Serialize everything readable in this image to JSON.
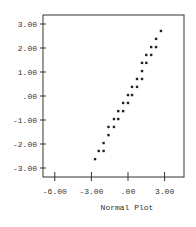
{
  "chart_data": {
    "type": "scatter",
    "title": "",
    "xlabel": "Normal Plot",
    "ylabel": "",
    "xlim": [
      -6.6,
      4.6
    ],
    "ylim": [
      -3.4,
      3.4
    ],
    "x_ticks": [
      -6.0,
      -3.0,
      0.0,
      3.0
    ],
    "x_tick_labels": [
      "-6.00",
      "-3.00",
      ".00",
      "3.00"
    ],
    "y_ticks": [
      3.0,
      2.0,
      1.0,
      0.0,
      -1.0,
      -2.0,
      -3.0
    ],
    "y_tick_labels": [
      "3.00",
      "2.00",
      "1.00",
      ".00",
      "-1.00",
      "-2.00",
      "-3.00"
    ],
    "grid": false,
    "legend": null,
    "marker": "star",
    "color": "#222222",
    "points": [
      {
        "x": -2.7,
        "y": -2.63
      },
      {
        "x": -2.4,
        "y": -2.29
      },
      {
        "x": -2.0,
        "y": -2.29
      },
      {
        "x": -2.0,
        "y": -1.96
      },
      {
        "x": -1.6,
        "y": -1.63
      },
      {
        "x": -1.6,
        "y": -1.29
      },
      {
        "x": -1.15,
        "y": -1.29
      },
      {
        "x": -1.15,
        "y": -0.96
      },
      {
        "x": -0.8,
        "y": -0.96
      },
      {
        "x": -0.8,
        "y": -0.63
      },
      {
        "x": -0.4,
        "y": -0.63
      },
      {
        "x": -0.4,
        "y": -0.29
      },
      {
        "x": 0.0,
        "y": -0.29
      },
      {
        "x": 0.0,
        "y": 0.04
      },
      {
        "x": 0.33,
        "y": 0.04
      },
      {
        "x": 0.33,
        "y": 0.38
      },
      {
        "x": 0.74,
        "y": 0.38
      },
      {
        "x": 0.74,
        "y": 0.71
      },
      {
        "x": 1.15,
        "y": 0.71
      },
      {
        "x": 1.15,
        "y": 1.04
      },
      {
        "x": 1.15,
        "y": 1.38
      },
      {
        "x": 1.5,
        "y": 1.38
      },
      {
        "x": 1.5,
        "y": 1.71
      },
      {
        "x": 1.9,
        "y": 1.71
      },
      {
        "x": 1.9,
        "y": 2.04
      },
      {
        "x": 2.3,
        "y": 2.04
      },
      {
        "x": 2.3,
        "y": 2.38
      },
      {
        "x": 2.7,
        "y": 2.71
      }
    ]
  },
  "layout": {
    "frame": {
      "left": 43,
      "top": 15,
      "right": 184,
      "bottom": 177
    },
    "x_px": {
      "origin": 128,
      "per_unit": 12.2
    },
    "y_px": {
      "origin": 96,
      "per_unit": 24
    }
  }
}
